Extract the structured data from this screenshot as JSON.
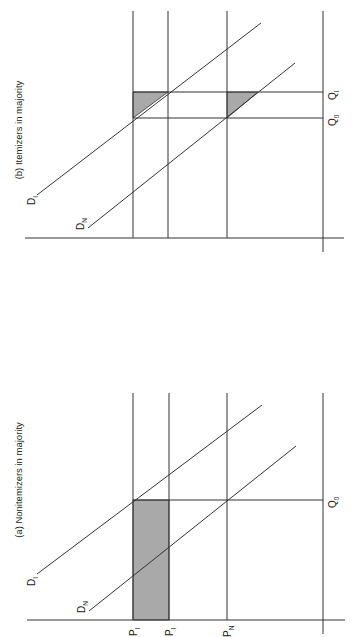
{
  "orientation": "rotated 90deg counter-clockwise (page in landscape)",
  "panels": [
    {
      "id": "a",
      "title": "(a) Nonitemizers in majority",
      "curves": [
        {
          "label": "D",
          "sub": "I"
        },
        {
          "label": "D",
          "sub": "N"
        }
      ],
      "price_labels": [
        {
          "label": "P",
          "sub": "I"
        },
        {
          "label": "P",
          "sub": "I"
        },
        {
          "label": "P",
          "sub": "N"
        }
      ],
      "quantity_labels": [
        {
          "label": "Q",
          "sub": "0"
        }
      ],
      "shaded_region": "rectangle",
      "shade_color": "#a9a9a9"
    },
    {
      "id": "b",
      "title": "(b) Itemizers in majority",
      "curves": [
        {
          "label": "D",
          "sub": "I"
        },
        {
          "label": "D",
          "sub": "N"
        }
      ],
      "quantity_labels": [
        {
          "label": "Q",
          "sub": "I"
        },
        {
          "label": "Q",
          "sub": "0"
        }
      ],
      "shaded_region": "two triangles",
      "shade_color": "#a9a9a9"
    }
  ]
}
